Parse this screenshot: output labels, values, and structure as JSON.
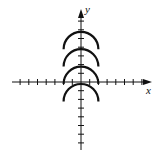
{
  "figure": {
    "type": "coordinate-plane-graph",
    "axes": {
      "x_label": "x",
      "y_label": "y",
      "x_ticks_negative": 7,
      "x_ticks_positive": 7,
      "y_ticks_negative": 7,
      "y_ticks_positive": 7,
      "tick_units_visible": false
    },
    "curves": [
      {
        "shape": "upper-semicircle",
        "center": [
          0,
          4
        ],
        "radius": 2
      },
      {
        "shape": "upper-semicircle",
        "center": [
          0,
          2
        ],
        "radius": 2
      },
      {
        "shape": "upper-semicircle",
        "center": [
          0,
          0
        ],
        "radius": 2
      },
      {
        "shape": "upper-semicircle",
        "center": [
          0,
          -2
        ],
        "radius": 2
      }
    ],
    "colors": {
      "stroke": "#111111",
      "background": "#ffffff"
    }
  }
}
